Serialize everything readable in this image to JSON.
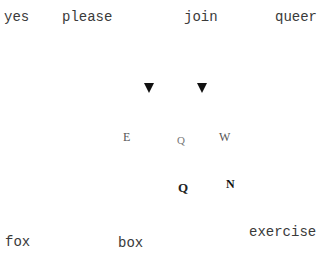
{
  "words": {
    "top": [
      "yes",
      "please",
      "join",
      "queer"
    ],
    "bottom": [
      "fox",
      "box",
      "exercise"
    ]
  },
  "glyphs": {
    "row1": [
      "▼",
      "▼"
    ],
    "row2": [
      "E",
      "Q",
      "W"
    ],
    "row3": [
      "Q",
      "N"
    ]
  }
}
